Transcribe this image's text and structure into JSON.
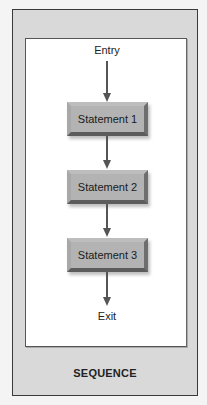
{
  "diagram": {
    "title": "SEQUENCE",
    "entry_label": "Entry",
    "exit_label": "Exit",
    "statements": [
      {
        "label": "Statement 1"
      },
      {
        "label": "Statement 2"
      },
      {
        "label": "Statement 3"
      }
    ]
  }
}
